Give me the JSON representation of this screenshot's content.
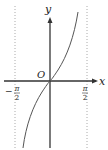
{
  "figure": {
    "function": "y = tan x",
    "domain": "(-π/2, π/2)",
    "axis_labels": {
      "x": "x",
      "y": "y",
      "origin": "O"
    },
    "tick_labels": {
      "left": {
        "sign": "−",
        "num": "π",
        "den": "2"
      },
      "right": {
        "num": "π",
        "den": "2"
      }
    },
    "asymptotes": [
      "x = −π/2",
      "x = π/2"
    ],
    "colors": {
      "axis": "#333333",
      "curve": "#555555",
      "asymptote": "#aaaaaa"
    }
  }
}
